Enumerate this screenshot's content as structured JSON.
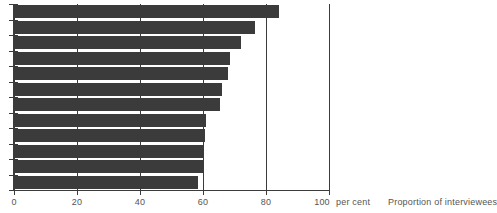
{
  "chart_data": {
    "type": "bar",
    "orientation": "horizontal",
    "title": "",
    "subtitle": "",
    "xlabel": "Proportion of interviewees",
    "ylabel": "",
    "unit_label": "per cent",
    "xlim": [
      0,
      100
    ],
    "xticks": [
      0,
      20,
      40,
      60,
      80,
      100
    ],
    "xtick_labels": [
      "0",
      "20",
      "40",
      "60",
      "80",
      "100"
    ],
    "grid": true,
    "grid_axis": "x",
    "legend": false,
    "legend_position": "none",
    "bar_color": "#3b3b3b",
    "axis_color": "#3b3b3b",
    "categories": [
      "",
      "",
      "",
      "",
      "",
      "",
      "",
      "",
      "",
      "",
      "",
      ""
    ],
    "values": [
      84,
      76.5,
      72,
      68.5,
      68,
      66,
      65.5,
      61,
      60.5,
      60,
      60,
      58.5
    ],
    "series": [
      {
        "name": "Proportion of interviewees",
        "values": [
          84,
          76.5,
          72,
          68.5,
          68,
          66,
          65.5,
          61,
          60.5,
          60,
          60,
          58.5
        ]
      }
    ]
  },
  "axis": {
    "caption": "Proportion of interviewees",
    "unit": "per cent",
    "tick_0": "0",
    "tick_20": "20",
    "tick_40": "40",
    "tick_60": "60",
    "tick_80": "80",
    "tick_100": "100"
  }
}
